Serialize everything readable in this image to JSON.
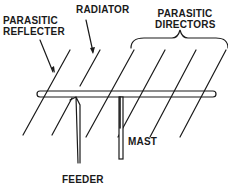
{
  "diagram": {
    "type": "yagi-antenna",
    "labels": {
      "reflector_line1": "PARASITIC",
      "reflector_line2": "REFLECTER",
      "radiator": "RADIATOR",
      "directors_line1": "PARASITIC",
      "directors_line2": "DIRECTORS",
      "mast": "MAST",
      "feeder": "FEEDER"
    },
    "elements": [
      "reflector",
      "radiator",
      "director-1",
      "director-2",
      "director-3"
    ],
    "colors": {
      "line": "#1a1a1a",
      "background": "#ffffff"
    }
  }
}
